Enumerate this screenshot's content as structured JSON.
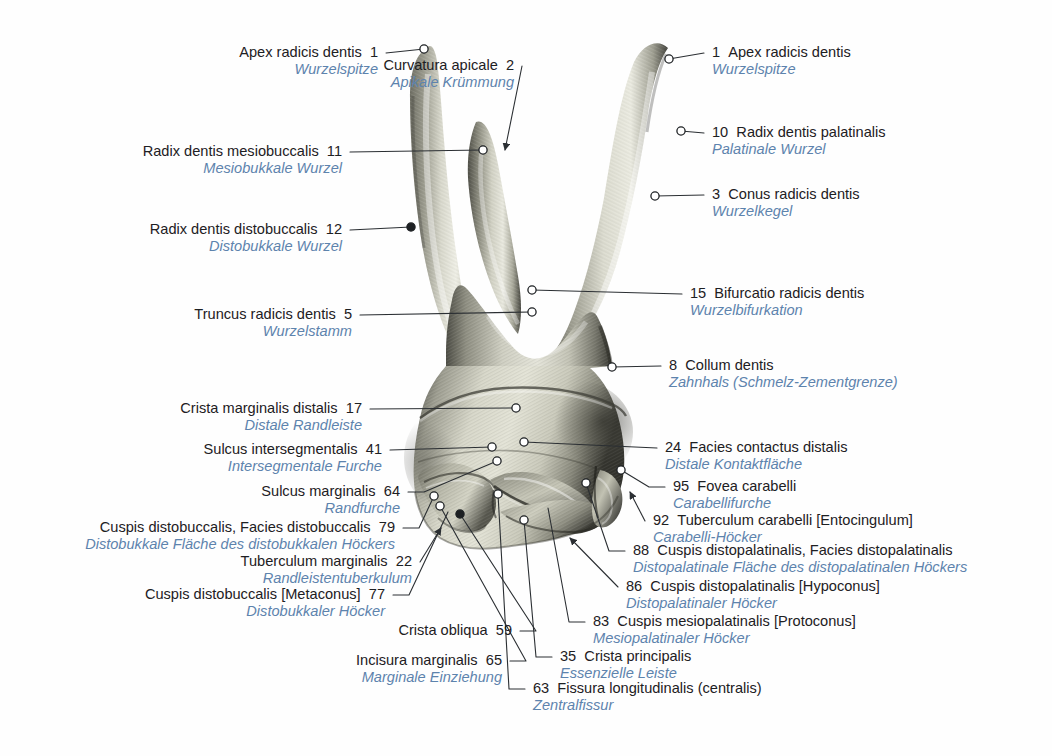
{
  "figure": {
    "background_color": "#ffffff",
    "latin_text_color": "#1d2023",
    "german_text_color": "#5d83ad",
    "leader_line_color": "#2b2f33",
    "marker_fill_open": "#ffffff",
    "marker_fill_closed": "#1d2023",
    "marker_stroke": "#1d2023"
  },
  "labels": [
    {
      "num": "1",
      "latin": "Apex radicis dentis",
      "german": "Wurzelspitze",
      "side": "left",
      "x": 378,
      "y": 44,
      "anchor_x": 424,
      "anchor_y": 49,
      "marker": "open"
    },
    {
      "num": "2",
      "latin": "Curvatura apicale",
      "german": "Apikale Krümmung",
      "side": "left",
      "x": 514,
      "y": 57,
      "anchor_x": 505,
      "anchor_y": 150,
      "marker": "arrow"
    },
    {
      "num": "1",
      "latin": "Apex radicis dentis",
      "german": "Wurzelspitze",
      "side": "right",
      "x": 712,
      "y": 44,
      "anchor_x": 669,
      "anchor_y": 59,
      "marker": "open"
    },
    {
      "num": "10",
      "latin": "Radix dentis palatinalis",
      "german": "Palatinale Wurzel",
      "side": "right",
      "x": 712,
      "y": 124,
      "anchor_x": 681,
      "anchor_y": 131,
      "marker": "open"
    },
    {
      "num": "3",
      "latin": "Conus radicis dentis",
      "german": "Wurzelkegel",
      "side": "right",
      "x": 712,
      "y": 186,
      "anchor_x": 655,
      "anchor_y": 196,
      "marker": "open"
    },
    {
      "num": "11",
      "latin": "Radix dentis mesiobuccalis",
      "german": "Mesiobukkale Wurzel",
      "side": "left",
      "x": 342,
      "y": 143,
      "anchor_x": 483,
      "anchor_y": 150,
      "marker": "open"
    },
    {
      "num": "12",
      "latin": "Radix dentis distobuccalis",
      "german": "Distobukkale Wurzel",
      "side": "left",
      "x": 342,
      "y": 221,
      "anchor_x": 411,
      "anchor_y": 227,
      "marker": "closed"
    },
    {
      "num": "15",
      "latin": "Bifurcatio radicis dentis",
      "german": "Wurzelbifurkation",
      "side": "right",
      "x": 690,
      "y": 285,
      "anchor_x": 532,
      "anchor_y": 290,
      "marker": "open"
    },
    {
      "num": "5",
      "latin": "Truncus radicis dentis",
      "german": "Wurzelstamm",
      "side": "left",
      "x": 352,
      "y": 306,
      "anchor_x": 532,
      "anchor_y": 312,
      "marker": "open"
    },
    {
      "num": "8",
      "latin": "Collum dentis",
      "german": "Zahnhals (Schmelz-Zementgrenze)",
      "side": "right",
      "x": 669,
      "y": 357,
      "anchor_x": 612,
      "anchor_y": 367,
      "marker": "open"
    },
    {
      "num": "17",
      "latin": "Crista marginalis distalis",
      "german": "Distale Randleiste",
      "side": "left",
      "x": 362,
      "y": 400,
      "anchor_x": 516,
      "anchor_y": 408,
      "marker": "open"
    },
    {
      "num": "24",
      "latin": "Facies contactus distalis",
      "german": "Distale Kontaktfläche",
      "side": "right",
      "x": 665,
      "y": 439,
      "anchor_x": 524,
      "anchor_y": 442,
      "marker": "open"
    },
    {
      "num": "41",
      "latin": "Sulcus intersegmentalis",
      "german": "Intersegmentale Furche",
      "side": "left",
      "x": 382,
      "y": 441,
      "anchor_x": 492,
      "anchor_y": 447,
      "marker": "open"
    },
    {
      "num": "95",
      "latin": "Fovea carabelli",
      "german": "Carabellifurche",
      "side": "right",
      "x": 673,
      "y": 478,
      "anchor_x": 621,
      "anchor_y": 470,
      "marker": "open"
    },
    {
      "num": "64",
      "latin": "Sulcus marginalis",
      "german": "Randfurche",
      "side": "left",
      "x": 400,
      "y": 483,
      "anchor_x": 497,
      "anchor_y": 461,
      "marker": "open"
    },
    {
      "num": "92",
      "latin": "Tuberculum carabelli [Entocingulum]",
      "german": "Carabelli-Höcker",
      "side": "right",
      "x": 653,
      "y": 512,
      "anchor_x": 630,
      "anchor_y": 492,
      "marker": "arrow"
    },
    {
      "num": "79",
      "latin": "Cuspis distobuccalis, Facies distobuccalis",
      "german": "Distobukkale Fläche des distobukkalen Höckers",
      "side": "left",
      "x": 395,
      "y": 519,
      "anchor_x": 434,
      "anchor_y": 496,
      "marker": "open"
    },
    {
      "num": "88",
      "latin": "Cuspis distopalatinalis, Facies distopalatinalis",
      "german": "Distopalatinale Fläche des distopalatinalen Höckers",
      "side": "right",
      "x": 633,
      "y": 542,
      "anchor_x": 586,
      "anchor_y": 483,
      "marker": "open"
    },
    {
      "num": "22",
      "latin": "Tuberculum marginalis",
      "german": "Randleistentuberkulum",
      "side": "left",
      "x": 412,
      "y": 553,
      "anchor_x": 441,
      "anchor_y": 528,
      "marker": "arrow"
    },
    {
      "num": "86",
      "latin": "Cuspis distopalatinalis [Hypoconus]",
      "german": "Distopalatinaler Höcker",
      "side": "right",
      "x": 626,
      "y": 578,
      "anchor_x": 570,
      "anchor_y": 538,
      "marker": "arrow"
    },
    {
      "num": "77",
      "latin": "Cuspis distobuccalis [Metaconus]",
      "german": "Distobukkaler Höcker",
      "side": "left",
      "x": 385,
      "y": 586,
      "anchor_x": 448,
      "anchor_y": 512,
      "marker": "none"
    },
    {
      "num": "83",
      "latin": "Cuspis mesiopalatinalis [Protoconus]",
      "german": "Mesiopalatinaler Höcker",
      "side": "right",
      "x": 593,
      "y": 613,
      "anchor_x": 548,
      "anchor_y": 508,
      "marker": "none"
    },
    {
      "num": "59",
      "latin": "Crista obliqua",
      "german": "",
      "side": "left",
      "x": 512,
      "y": 622,
      "anchor_x": 460,
      "anchor_y": 514,
      "marker": "closed"
    },
    {
      "num": "35",
      "latin": "Crista principalis",
      "german": "Essenzielle Leiste",
      "side": "right",
      "x": 560,
      "y": 648,
      "anchor_x": 524,
      "anchor_y": 520,
      "marker": "open"
    },
    {
      "num": "65",
      "latin": "Incisura marginalis",
      "german": "Marginale Einziehung",
      "side": "left",
      "x": 502,
      "y": 652,
      "anchor_x": 440,
      "anchor_y": 506,
      "marker": "open"
    },
    {
      "num": "63",
      "latin": "Fissura longitudinalis (centralis)",
      "german": "Zentralfissur",
      "side": "right",
      "x": 533,
      "y": 680,
      "anchor_x": 498,
      "anchor_y": 494,
      "marker": "open"
    }
  ]
}
